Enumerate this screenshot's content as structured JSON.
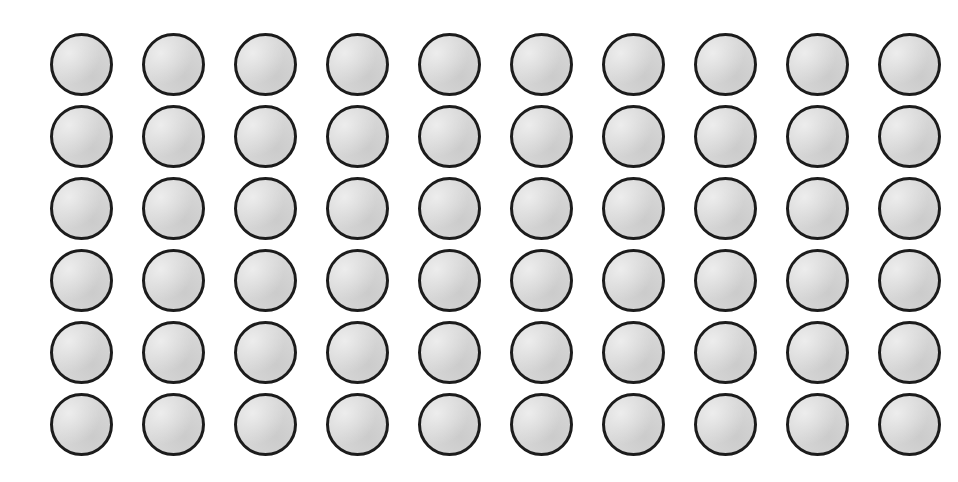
{
  "page": {
    "background_color": "#ffffff",
    "width": 958,
    "height": 482
  },
  "grid": {
    "name": "circle-array",
    "columns": 10,
    "rows": 6,
    "total_circles": 60,
    "left": 50,
    "top": 33,
    "column_pitch": 92,
    "row_pitch": 72,
    "circle_diameter": 63,
    "horizontal_gap": 29,
    "vertical_gap": 9
  },
  "circle_style": {
    "fill_color": "#d7d7d7",
    "stroke_color": "#1c1c1c",
    "stroke_width": 3,
    "shape": "circle"
  },
  "labels": {
    "circle_name": "circle",
    "row_name": "circle-row"
  }
}
